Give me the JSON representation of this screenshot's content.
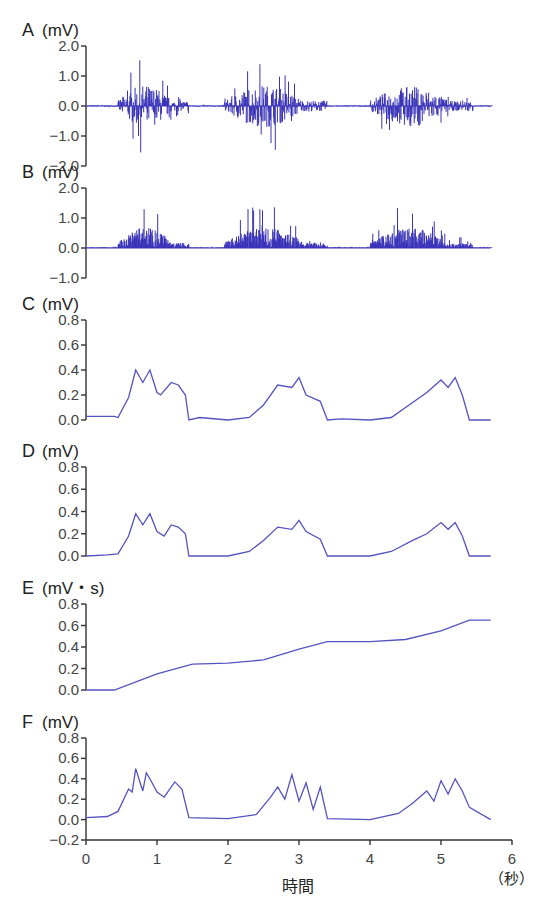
{
  "colors": {
    "trace": "#3a33b8",
    "trace_light": "#5553c0",
    "axis": "#333333"
  },
  "xaxis": {
    "label": "時間",
    "unit": "（秒）",
    "ticks": [
      "0",
      "1",
      "2",
      "3",
      "4",
      "5",
      "6"
    ],
    "range": [
      0,
      6
    ]
  },
  "chart_data": [
    {
      "panel": "A",
      "type": "line",
      "title": "A",
      "ylabel": "(mV)",
      "ylim": [
        -2.0,
        2.0
      ],
      "yticks": [
        "2.0",
        "1.0",
        "0.0",
        "-1.0",
        "-2.0"
      ],
      "description": "Raw EMG signal: three bursts around 0.5–1.5 s, 2.0–3.4 s, 4.0–5.4 s, amplitude up to ~±1.5 mV"
    },
    {
      "panel": "B",
      "type": "line",
      "title": "B",
      "ylabel": "(mV)",
      "ylim": [
        -1.0,
        2.0
      ],
      "yticks": [
        "2.0",
        "1.0",
        "0.0",
        "-1.0"
      ],
      "description": "Full-wave rectified EMG: peaks up to ~1.5–1.7 mV"
    },
    {
      "panel": "C",
      "type": "line",
      "title": "C",
      "ylabel": "(mV)",
      "ylim": [
        0.0,
        0.8
      ],
      "yticks": [
        "0.8",
        "0.6",
        "0.4",
        "0.2",
        "0.0"
      ],
      "x": [
        0,
        0.4,
        0.45,
        0.6,
        0.7,
        0.8,
        0.9,
        1.0,
        1.05,
        1.2,
        1.3,
        1.4,
        1.45,
        1.6,
        2.0,
        2.3,
        2.5,
        2.7,
        2.9,
        3.0,
        3.1,
        3.3,
        3.4,
        3.6,
        4.0,
        4.3,
        4.6,
        4.8,
        5.0,
        5.1,
        5.2,
        5.3,
        5.4,
        5.7
      ],
      "values": [
        0.03,
        0.03,
        0.02,
        0.18,
        0.4,
        0.3,
        0.4,
        0.22,
        0.2,
        0.3,
        0.28,
        0.2,
        0.0,
        0.02,
        0.0,
        0.02,
        0.12,
        0.28,
        0.26,
        0.34,
        0.2,
        0.15,
        0.0,
        0.01,
        0.0,
        0.02,
        0.14,
        0.22,
        0.32,
        0.26,
        0.34,
        0.2,
        0.0,
        0.0
      ]
    },
    {
      "panel": "D",
      "type": "line",
      "title": "D",
      "ylabel": "(mV)",
      "ylim": [
        0.0,
        0.8
      ],
      "yticks": [
        "0.8",
        "0.6",
        "0.4",
        "0.2",
        "0.0"
      ],
      "x": [
        0,
        0.3,
        0.45,
        0.6,
        0.7,
        0.8,
        0.9,
        1.0,
        1.1,
        1.2,
        1.3,
        1.4,
        1.45,
        2.0,
        2.3,
        2.5,
        2.7,
        2.9,
        3.0,
        3.1,
        3.3,
        3.4,
        4.0,
        4.3,
        4.6,
        4.8,
        5.0,
        5.1,
        5.2,
        5.3,
        5.4,
        5.7
      ],
      "values": [
        0.0,
        0.01,
        0.02,
        0.18,
        0.38,
        0.28,
        0.38,
        0.22,
        0.18,
        0.28,
        0.26,
        0.2,
        0.0,
        0.0,
        0.04,
        0.14,
        0.26,
        0.24,
        0.32,
        0.22,
        0.15,
        0.0,
        0.0,
        0.04,
        0.14,
        0.2,
        0.3,
        0.24,
        0.3,
        0.18,
        0.0,
        0.0
      ]
    },
    {
      "panel": "E",
      "type": "line",
      "title": "E",
      "ylabel": "(mV・s)",
      "ylim": [
        0.0,
        0.8
      ],
      "yticks": [
        "0.8",
        "0.6",
        "0.4",
        "0.2",
        "0.0"
      ],
      "x": [
        0,
        0.4,
        1.0,
        1.5,
        2.0,
        2.5,
        3.0,
        3.4,
        4.0,
        4.5,
        5.0,
        5.4,
        5.7
      ],
      "values": [
        0.0,
        0.0,
        0.15,
        0.24,
        0.25,
        0.28,
        0.38,
        0.45,
        0.45,
        0.47,
        0.55,
        0.65,
        0.65
      ]
    },
    {
      "panel": "F",
      "type": "line",
      "title": "F",
      "ylabel": "(mV)",
      "ylim": [
        -0.2,
        0.8
      ],
      "yticks": [
        "0.8",
        "0.6",
        "0.4",
        "0.2",
        "0.0",
        "-0.2"
      ],
      "x": [
        0,
        0.3,
        0.45,
        0.6,
        0.65,
        0.7,
        0.8,
        0.85,
        0.9,
        1.0,
        1.1,
        1.25,
        1.35,
        1.45,
        2.0,
        2.4,
        2.6,
        2.7,
        2.8,
        2.9,
        3.0,
        3.1,
        3.2,
        3.3,
        3.4,
        4.0,
        4.4,
        4.6,
        4.8,
        4.9,
        5.0,
        5.1,
        5.2,
        5.3,
        5.4,
        5.7
      ],
      "values": [
        0.02,
        0.03,
        0.08,
        0.3,
        0.27,
        0.5,
        0.28,
        0.46,
        0.4,
        0.27,
        0.22,
        0.37,
        0.3,
        0.02,
        0.01,
        0.05,
        0.22,
        0.32,
        0.2,
        0.44,
        0.18,
        0.36,
        0.1,
        0.32,
        0.01,
        0.0,
        0.06,
        0.16,
        0.28,
        0.18,
        0.38,
        0.25,
        0.4,
        0.28,
        0.12,
        0.0
      ]
    }
  ]
}
